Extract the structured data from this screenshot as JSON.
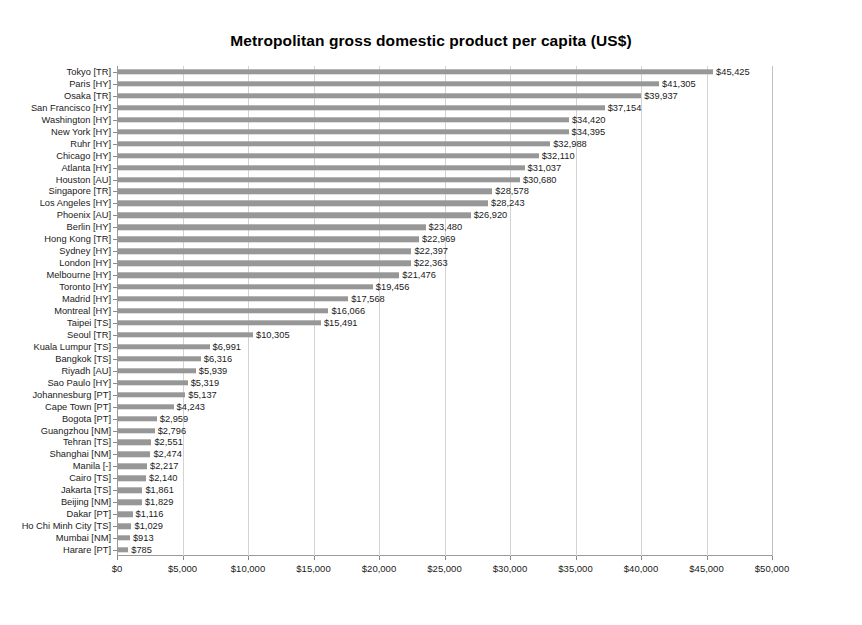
{
  "chart_data": {
    "type": "bar",
    "orientation": "horizontal",
    "title": "Metropolitan gross domestic product per capita (US$)",
    "xlabel": "",
    "ylabel": "",
    "xlim": [
      0,
      50000
    ],
    "xticks": [
      0,
      5000,
      10000,
      15000,
      20000,
      25000,
      30000,
      35000,
      40000,
      45000,
      50000
    ],
    "xtick_labels": [
      "$0",
      "$5,000",
      "$10,000",
      "$15,000",
      "$20,000",
      "$25,000",
      "$30,000",
      "$35,000",
      "$40,000",
      "$45,000",
      "$50,000"
    ],
    "grid": true,
    "grid_axis": "x",
    "legend": false,
    "bar_color": "#979797",
    "categories": [
      "Tokyo [TR]",
      "Paris [HY]",
      "Osaka [TR]",
      "San Francisco [HY]",
      "Washington [HY]",
      "New York [HY]",
      "Ruhr [HY]",
      "Chicago [HY]",
      "Atlanta [HY]",
      "Houston [AU]",
      "Singapore [TR]",
      "Los Angeles [HY]",
      "Phoenix [AU]",
      "Berlin [HY]",
      "Hong Kong [TR]",
      "Sydney [HY]",
      "London [HY]",
      "Melbourne [HY]",
      "Toronto [HY]",
      "Madrid [HY]",
      "Montreal [HY]",
      "Taipei [TS]",
      "Seoul [TR]",
      "Kuala Lumpur [TS]",
      "Bangkok [TS]",
      "Riyadh [AU]",
      "Sao Paulo [HY]",
      "Johannesburg [PT]",
      "Cape Town [PT]",
      "Bogota [PT]",
      "Guangzhou [NM]",
      "Tehran [TS]",
      "Shanghai [NM]",
      "Manila [-]",
      "Cairo [TS]",
      "Jakarta [TS]",
      "Beijing [NM]",
      "Dakar [PT]",
      "Ho Chi Minh City [TS]",
      "Mumbai [NM]",
      "Harare [PT]"
    ],
    "values": [
      45425,
      41305,
      39937,
      37154,
      34420,
      34395,
      32988,
      32110,
      31037,
      30680,
      28578,
      28243,
      26920,
      23480,
      22969,
      22397,
      22363,
      21476,
      19456,
      17568,
      16066,
      15491,
      10305,
      6991,
      6316,
      5939,
      5319,
      5137,
      4243,
      2959,
      2796,
      2551,
      2474,
      2217,
      2140,
      1861,
      1829,
      1116,
      1029,
      913,
      785
    ],
    "value_labels": [
      "$45,425",
      "$41,305",
      "$39,937",
      "$37,154",
      "$34,420",
      "$34,395",
      "$32,988",
      "$32,110",
      "$31,037",
      "$30,680",
      "$28,578",
      "$28,243",
      "$26,920",
      "$23,480",
      "$22,969",
      "$22,397",
      "$22,363",
      "$21,476",
      "$19,456",
      "$17,568",
      "$16,066",
      "$15,491",
      "$10,305",
      "$6,991",
      "$6,316",
      "$5,939",
      "$5,319",
      "$5,137",
      "$4,243",
      "$2,959",
      "$2,796",
      "$2,551",
      "$2,474",
      "$2,217",
      "$2,140",
      "$1,861",
      "$1,829",
      "$1,116",
      "$1,029",
      "$913",
      "$785"
    ]
  }
}
